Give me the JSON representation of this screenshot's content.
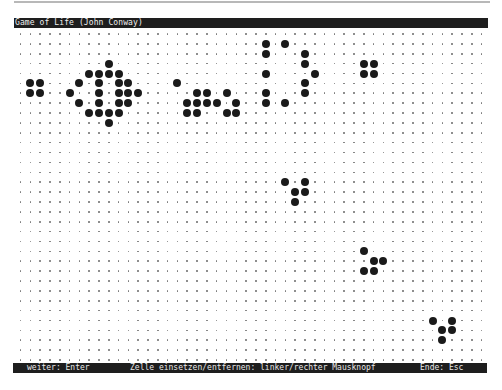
{
  "window": {
    "title": "Game of Life (John Conway)"
  },
  "grid": {
    "cols": 48,
    "rows": 34,
    "origin_x": 20.5,
    "origin_y": 34,
    "step_x": 9.81,
    "step_y": 9.88,
    "dot_color": "#777777",
    "cell_color": "#1a1a1a",
    "live_cells": [
      [
        1,
        5
      ],
      [
        2,
        5
      ],
      [
        1,
        6
      ],
      [
        2,
        6
      ],
      [
        9,
        3
      ],
      [
        7,
        4
      ],
      [
        8,
        4
      ],
      [
        9,
        4
      ],
      [
        10,
        4
      ],
      [
        6,
        5
      ],
      [
        8,
        5
      ],
      [
        10,
        5
      ],
      [
        11,
        5
      ],
      [
        5,
        6
      ],
      [
        8,
        6
      ],
      [
        10,
        6
      ],
      [
        11,
        6
      ],
      [
        12,
        6
      ],
      [
        6,
        7
      ],
      [
        8,
        7
      ],
      [
        10,
        7
      ],
      [
        11,
        7
      ],
      [
        7,
        8
      ],
      [
        8,
        8
      ],
      [
        9,
        8
      ],
      [
        10,
        8
      ],
      [
        9,
        9
      ],
      [
        16,
        5
      ],
      [
        18,
        6
      ],
      [
        19,
        6
      ],
      [
        21,
        6
      ],
      [
        17,
        7
      ],
      [
        18,
        7
      ],
      [
        19,
        7
      ],
      [
        20,
        7
      ],
      [
        22,
        7
      ],
      [
        17,
        8
      ],
      [
        18,
        8
      ],
      [
        21,
        8
      ],
      [
        22,
        8
      ],
      [
        25,
        1
      ],
      [
        27,
        1
      ],
      [
        25,
        2
      ],
      [
        29,
        2
      ],
      [
        29,
        3
      ],
      [
        25,
        4
      ],
      [
        30,
        4
      ],
      [
        29,
        5
      ],
      [
        25,
        6
      ],
      [
        29,
        6
      ],
      [
        25,
        7
      ],
      [
        27,
        7
      ],
      [
        35,
        3
      ],
      [
        36,
        3
      ],
      [
        35,
        4
      ],
      [
        36,
        4
      ],
      [
        27,
        15
      ],
      [
        29,
        15
      ],
      [
        28,
        16
      ],
      [
        29,
        16
      ],
      [
        28,
        17
      ],
      [
        35,
        22
      ],
      [
        36,
        23
      ],
      [
        37,
        23
      ],
      [
        35,
        24
      ],
      [
        36,
        24
      ],
      [
        42,
        29
      ],
      [
        44,
        29
      ],
      [
        43,
        30
      ],
      [
        44,
        30
      ],
      [
        43,
        31
      ]
    ]
  },
  "statusbar": {
    "continue": "weiter: Enter",
    "toggle_cell": "Zelle einsetzen/entfernen: linker/rechter Mausknopf",
    "quit": "Ende: Esc"
  }
}
